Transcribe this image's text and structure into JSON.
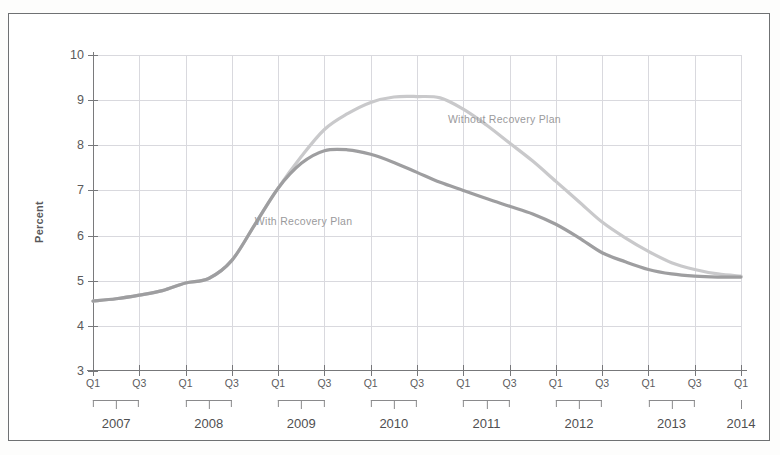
{
  "chart_data": {
    "type": "line",
    "title": "",
    "subtitle": "",
    "xlabel": "",
    "ylabel": "Percent",
    "ylim": [
      3,
      10
    ],
    "yticks": [
      3,
      4,
      5,
      6,
      7,
      8,
      9,
      10
    ],
    "grid": true,
    "legend_position": "inline-annotation",
    "x_tick_labels": [
      "Q1",
      "Q3",
      "Q1",
      "Q3",
      "Q1",
      "Q3",
      "Q1",
      "Q3",
      "Q1",
      "Q3",
      "Q1",
      "Q3",
      "Q1",
      "Q3",
      "Q1"
    ],
    "year_groups": [
      {
        "label": "2007",
        "quarters": [
          "Q1",
          "Q3"
        ]
      },
      {
        "label": "2008",
        "quarters": [
          "Q1",
          "Q3"
        ]
      },
      {
        "label": "2009",
        "quarters": [
          "Q1",
          "Q3"
        ]
      },
      {
        "label": "2010",
        "quarters": [
          "Q1",
          "Q3"
        ]
      },
      {
        "label": "2011",
        "quarters": [
          "Q1",
          "Q3"
        ]
      },
      {
        "label": "2012",
        "quarters": [
          "Q1",
          "Q3"
        ]
      },
      {
        "label": "2013",
        "quarters": [
          "Q1",
          "Q3"
        ]
      },
      {
        "label": "2014",
        "quarters": [
          "Q1"
        ]
      }
    ],
    "x": [
      "2007Q1",
      "2007Q2",
      "2007Q3",
      "2007Q4",
      "2008Q1",
      "2008Q2",
      "2008Q3",
      "2008Q4",
      "2009Q1",
      "2009Q2",
      "2009Q3",
      "2009Q4",
      "2010Q1",
      "2010Q2",
      "2010Q3",
      "2010Q4",
      "2011Q1",
      "2011Q2",
      "2011Q3",
      "2011Q4",
      "2012Q1",
      "2012Q2",
      "2012Q3",
      "2012Q4",
      "2013Q1",
      "2013Q2",
      "2013Q3",
      "2013Q4",
      "2014Q1"
    ],
    "series": [
      {
        "name": "Without Recovery Plan",
        "color": "#c9c9cb",
        "values": [
          4.55,
          4.6,
          4.68,
          4.78,
          4.95,
          5.05,
          5.45,
          6.25,
          7.05,
          7.75,
          8.35,
          8.7,
          8.95,
          9.07,
          9.08,
          9.05,
          8.8,
          8.45,
          8.05,
          7.65,
          7.2,
          6.75,
          6.3,
          5.95,
          5.65,
          5.4,
          5.25,
          5.15,
          5.1
        ]
      },
      {
        "name": "With Recovery Plan",
        "color": "#9e9ea0",
        "values": [
          4.55,
          4.6,
          4.68,
          4.78,
          4.95,
          5.05,
          5.45,
          6.25,
          7.05,
          7.6,
          7.88,
          7.9,
          7.8,
          7.62,
          7.4,
          7.18,
          7.0,
          6.82,
          6.65,
          6.48,
          6.25,
          5.95,
          5.62,
          5.42,
          5.25,
          5.15,
          5.1,
          5.08,
          5.08
        ]
      }
    ],
    "annotations": [
      {
        "text": "Without Recovery Plan",
        "series": "Without Recovery Plan",
        "x_px_pct": 63.5,
        "y_px_pct": 20.3
      },
      {
        "text": "With Recovery Plan",
        "series": "With Recovery Plan",
        "x_px_pct": 32.5,
        "y_px_pct": 52.5
      }
    ]
  },
  "axis": {
    "y_title": "Percent"
  }
}
